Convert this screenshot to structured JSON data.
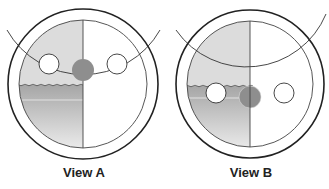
{
  "views": [
    {
      "label": "View A",
      "center": [
        83,
        84
      ],
      "outer_radius": 75,
      "inner_radius": 64,
      "left_circle": {
        "cx": 49,
        "cy": 64,
        "r": 10,
        "fill": "#ffffff"
      },
      "center_circle": {
        "cx": 83,
        "cy": 70,
        "r": 11,
        "fill": "#8e8e8e"
      },
      "right_circle": {
        "cx": 117,
        "cy": 64,
        "r": 10,
        "fill": "#ffffff"
      },
      "water_line_y": 85
    },
    {
      "label": "View B",
      "center": [
        250,
        84
      ],
      "outer_radius": 74,
      "inner_radius": 63,
      "left_circle": {
        "cx": 216,
        "cy": 93,
        "r": 10,
        "fill": "#ffffff"
      },
      "center_circle": {
        "cx": 250,
        "cy": 97,
        "r": 11,
        "fill": "#8e8e8e"
      },
      "right_circle": {
        "cx": 284,
        "cy": 93,
        "r": 10,
        "fill": "#ffffff"
      },
      "water_line_y": 86
    }
  ],
  "colors": {
    "outline": "#222222",
    "upper_shade": "#dcdcdc",
    "lower_shade_top": "#a9a9a9",
    "lower_shade_bottom": "#f0f0f0",
    "ball_dark": "#8e8e8e"
  }
}
